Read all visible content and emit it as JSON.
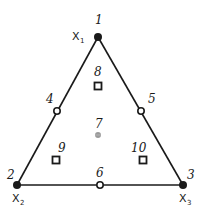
{
  "diagram": {
    "type": "simplex-lattice ternary design",
    "vertices": [
      {
        "id": "1",
        "var": "X",
        "sub": "1",
        "x": 98,
        "y": 37
      },
      {
        "id": "2",
        "var": "X",
        "sub": "2",
        "x": 17,
        "y": 185
      },
      {
        "id": "3",
        "var": "X",
        "sub": "3",
        "x": 183,
        "y": 185
      }
    ],
    "points": [
      {
        "id": "1",
        "marker": "filled-circle"
      },
      {
        "id": "2",
        "marker": "filled-circle"
      },
      {
        "id": "3",
        "marker": "filled-circle"
      },
      {
        "id": "4",
        "marker": "open-circle",
        "x": 57,
        "y": 111
      },
      {
        "id": "5",
        "marker": "open-circle",
        "x": 141,
        "y": 111
      },
      {
        "id": "6",
        "marker": "open-circle",
        "x": 100,
        "y": 185
      },
      {
        "id": "7",
        "marker": "grey-dot",
        "x": 98,
        "y": 135
      },
      {
        "id": "8",
        "marker": "open-square",
        "x": 98,
        "y": 86
      },
      {
        "id": "9",
        "marker": "open-square",
        "x": 56,
        "y": 160
      },
      {
        "id": "10",
        "marker": "open-square",
        "x": 143,
        "y": 160
      }
    ],
    "labels": {
      "p1": "1",
      "p2": "2",
      "p3": "3",
      "p4": "4",
      "p5": "5",
      "p6": "6",
      "p7": "7",
      "p8": "8",
      "p9": "9",
      "p10": "10",
      "x1_var": "X",
      "x1_sub": "1",
      "x2_var": "X",
      "x2_sub": "2",
      "x3_var": "X",
      "x3_sub": "3"
    },
    "colors": {
      "line": "#1a1a1a",
      "point7": "#8a8a8a"
    }
  }
}
